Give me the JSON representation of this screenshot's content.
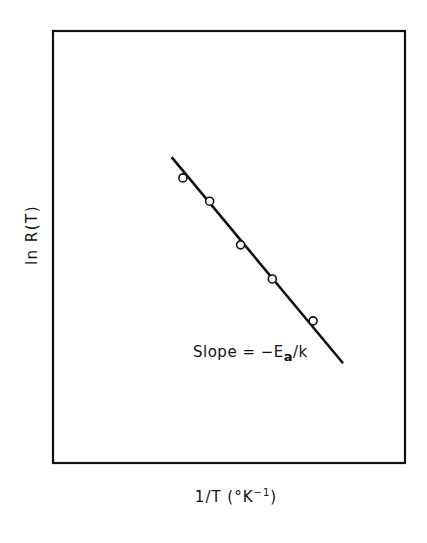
{
  "chart_data": {
    "type": "scatter",
    "title": "",
    "xlabel": "1/T (°K⁻¹)",
    "ylabel": "ln R(T)",
    "xlabel_parts": {
      "main": "1/T (°K",
      "sup": "−1",
      "close": ")"
    },
    "annotation": {
      "prefix": "Slope = −E",
      "subscript": "a",
      "suffix": "/k"
    },
    "axes": {
      "ticks": "none",
      "grid": false,
      "frame": "box"
    },
    "coordinate_note": "no tick labels; values normalized to plot frame (0–1, origin at bottom-left)",
    "xlim": [
      0,
      1
    ],
    "ylim": [
      0,
      1
    ],
    "series": [
      {
        "name": "measured points",
        "marker": "open-circle",
        "x": [
          0.369,
          0.445,
          0.533,
          0.623,
          0.739
        ],
        "y": [
          0.66,
          0.606,
          0.505,
          0.426,
          0.329
        ]
      },
      {
        "name": "linear fit",
        "style": "solid-line",
        "x": [
          0.337,
          0.824
        ],
        "y": [
          0.708,
          0.231
        ]
      }
    ],
    "legend": null
  },
  "plot_frame": {
    "left": 53,
    "top": 31,
    "right": 405,
    "bottom": 463
  },
  "colors": {
    "ink": "#111111",
    "background": "#ffffff"
  }
}
